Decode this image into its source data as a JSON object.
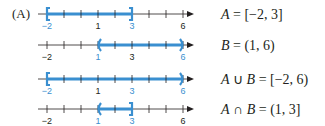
{
  "part_label": "(A)",
  "colors": {
    "highlight": "#3a8fd0",
    "axis": "#231f20"
  },
  "axis": {
    "min": -2,
    "max": 6,
    "x_start": 47,
    "unit_px": 17,
    "line_left": 38,
    "arrow_tip": 194
  },
  "rows": [
    {
      "y": 14,
      "interval": {
        "from": -2,
        "to": 3,
        "left": "closed",
        "right": "closed"
      },
      "labels": [
        {
          "v": -2,
          "text": "−2",
          "hl": true
        },
        {
          "v": 1,
          "text": "1",
          "hl": false
        },
        {
          "v": 3,
          "text": "3",
          "hl": true
        },
        {
          "v": 6,
          "text": "6",
          "hl": false
        }
      ],
      "equation": {
        "lhs": "A",
        "op": "",
        "rhs2": "",
        "value": "= [−2, 3]"
      }
    },
    {
      "y": 45,
      "interval": {
        "from": 1,
        "to": 6,
        "left": "open",
        "right": "open"
      },
      "labels": [
        {
          "v": -2,
          "text": "−2",
          "hl": false
        },
        {
          "v": 1,
          "text": "1",
          "hl": true
        },
        {
          "v": 3,
          "text": "3",
          "hl": false
        },
        {
          "v": 6,
          "text": "6",
          "hl": true
        }
      ],
      "equation": {
        "lhs": "B",
        "op": "",
        "rhs2": "",
        "value": "= (1, 6)"
      }
    },
    {
      "y": 79,
      "interval": {
        "from": -2,
        "to": 6,
        "left": "closed",
        "right": "open"
      },
      "labels": [
        {
          "v": -2,
          "text": "−2",
          "hl": true
        },
        {
          "v": 1,
          "text": "1",
          "hl": false
        },
        {
          "v": 3,
          "text": "3",
          "hl": true
        },
        {
          "v": 6,
          "text": "6",
          "hl": true
        }
      ],
      "equation": {
        "lhs": "A",
        "op": "∪",
        "rhs2": "B",
        "value": "= [−2, 6)"
      }
    },
    {
      "y": 109,
      "interval": {
        "from": 1,
        "to": 3,
        "left": "open",
        "right": "closed"
      },
      "labels": [
        {
          "v": -2,
          "text": "−2",
          "hl": false
        },
        {
          "v": 1,
          "text": "1",
          "hl": true
        },
        {
          "v": 3,
          "text": "3",
          "hl": true
        },
        {
          "v": 6,
          "text": "6",
          "hl": false
        }
      ],
      "equation": {
        "lhs": "A",
        "op": "∩",
        "rhs2": "B",
        "value": "= (1, 3]"
      }
    }
  ]
}
